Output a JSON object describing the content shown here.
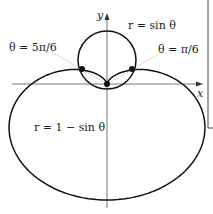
{
  "diagram": {
    "type": "polar-curves",
    "axes": {
      "x_label": "x",
      "y_label": "y"
    },
    "curves": [
      {
        "name": "circle",
        "equation": "r = sin θ"
      },
      {
        "name": "cardioid",
        "equation": "r = 1 − sin θ"
      }
    ],
    "intersections": [
      {
        "label": "θ = 5π/6"
      },
      {
        "label": "θ = π/6"
      },
      {
        "label": "origin"
      }
    ],
    "colors": {
      "curve": "#111111",
      "axis": "#555555",
      "guide": "#9a9a9a"
    }
  }
}
